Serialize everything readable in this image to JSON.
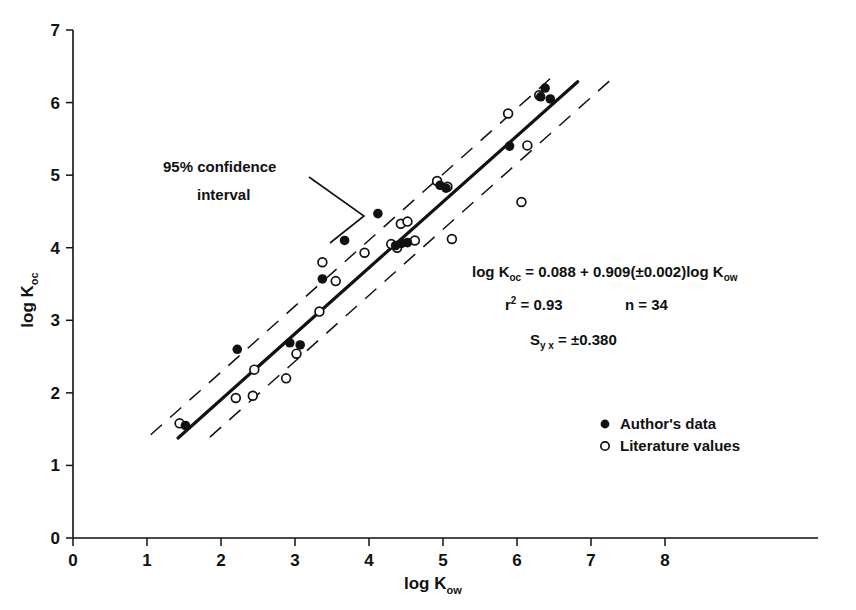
{
  "chart_data": {
    "type": "scatter",
    "title": "",
    "xlabel": "log K_ow",
    "ylabel": "log K_oc",
    "xlabel_base": "log K",
    "xlabel_sub": "ow",
    "ylabel_base": "log K",
    "ylabel_sub": "oc",
    "xlim": [
      0,
      8.6
    ],
    "ylim": [
      0,
      7
    ],
    "grid": false,
    "x_ticks": [
      "0",
      "1",
      "2",
      "3",
      "4",
      "5",
      "6",
      "7",
      "8"
    ],
    "y_ticks": [
      "0",
      "1",
      "2",
      "3",
      "4",
      "5",
      "6",
      "7"
    ],
    "x_tick_values": [
      0,
      1,
      2,
      3,
      4,
      5,
      6,
      7,
      8
    ],
    "y_tick_values": [
      0,
      1,
      2,
      3,
      4,
      5,
      6,
      7
    ],
    "legend_position": "lower-right",
    "series": [
      {
        "name": "Author's data",
        "marker": "filled-circle",
        "color": "#111111",
        "points": [
          [
            1.52,
            1.55
          ],
          [
            2.22,
            2.6
          ],
          [
            2.93,
            2.69
          ],
          [
            3.07,
            2.66
          ],
          [
            3.37,
            3.57
          ],
          [
            3.67,
            4.1
          ],
          [
            4.12,
            4.47
          ],
          [
            4.36,
            4.03
          ],
          [
            4.44,
            4.06
          ],
          [
            4.52,
            4.07
          ],
          [
            4.96,
            4.86
          ],
          [
            5.04,
            4.82
          ],
          [
            5.9,
            5.4
          ],
          [
            6.32,
            6.08
          ],
          [
            6.38,
            6.2
          ],
          [
            6.45,
            6.05
          ]
        ]
      },
      {
        "name": "Literature values",
        "marker": "open-circle",
        "color": "#111111",
        "points": [
          [
            1.44,
            1.58
          ],
          [
            2.2,
            1.93
          ],
          [
            2.43,
            1.96
          ],
          [
            2.45,
            2.32
          ],
          [
            2.88,
            2.2
          ],
          [
            3.02,
            2.54
          ],
          [
            3.33,
            3.12
          ],
          [
            3.37,
            3.8
          ],
          [
            3.55,
            3.54
          ],
          [
            3.94,
            3.93
          ],
          [
            4.3,
            4.05
          ],
          [
            4.38,
            4.0
          ],
          [
            4.43,
            4.33
          ],
          [
            4.52,
            4.36
          ],
          [
            4.62,
            4.1
          ],
          [
            4.92,
            4.92
          ],
          [
            5.06,
            4.84
          ],
          [
            5.12,
            4.12
          ],
          [
            5.88,
            5.85
          ],
          [
            6.06,
            4.63
          ],
          [
            6.14,
            5.41
          ],
          [
            6.3,
            6.1
          ]
        ]
      }
    ],
    "fit": {
      "intercept": 0.088,
      "slope": 0.909,
      "slope_error": 0.002,
      "x_start": 1.42,
      "x_end": 6.82,
      "style": "solid"
    },
    "confidence_bands": {
      "label": "95% confidence interval",
      "offset": 0.38,
      "style": "dashed",
      "upper_x_start": 1.05,
      "upper_x_end": 6.55,
      "lower_x_start": 1.85,
      "lower_x_end": 7.35
    },
    "annotations": [
      {
        "name": "confidence-interval-label",
        "line1": "95% confidence",
        "line2": "interval"
      }
    ],
    "equation": {
      "line1_parts": [
        "log K",
        "oc",
        " = 0.088 + 0.909(±0.002)log K",
        "ow"
      ],
      "line1_text": "log Koc = 0.088 + 0.909(±0.002)log Kow",
      "r2_symbol": "r",
      "r2_exponent": "2",
      "r2_value": " = 0.93",
      "n_value": "n = 34",
      "sy_symbol": "S",
      "sy_sub": "y x",
      "sy_value": " = ±0.380"
    },
    "legend_entries": [
      {
        "marker": "filled-circle",
        "label": "Author's data"
      },
      {
        "marker": "open-circle",
        "label": "Literature values"
      }
    ]
  },
  "axes": {
    "x_title_base": "log K",
    "x_title_sub": "ow",
    "y_title_base": "log K",
    "y_title_sub": "oc"
  },
  "ticks": {
    "x": [
      "0",
      "1",
      "2",
      "3",
      "4",
      "5",
      "6",
      "7",
      "8"
    ],
    "y": [
      "0",
      "1",
      "2",
      "3",
      "4",
      "5",
      "6",
      "7"
    ]
  },
  "annotation": {
    "ci_line1": "95% confidence",
    "ci_line2": "interval"
  },
  "equation": {
    "log_k": "log K",
    "sub_oc": "oc",
    "body": " = 0.088 + 0.909(±0.002)log K",
    "sub_ow": "ow",
    "r_symbol": "r",
    "r_exp": "2",
    "r_rest": " = 0.93",
    "n_text": "n = 34",
    "s_symbol": "S",
    "s_sub": "y x",
    "s_rest": " = ±0.380"
  },
  "legend": {
    "author_label": "Author's data",
    "literature_label": "Literature values"
  },
  "colors": {
    "ink": "#111111",
    "paper": "#ffffff"
  }
}
